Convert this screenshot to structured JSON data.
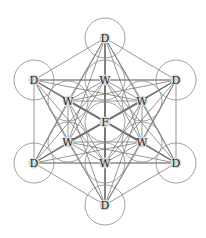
{
  "diagram": {
    "colors": {
      "line": "#6a6a6a",
      "ring": "#8a8a8a",
      "halo": "#d8d8d8",
      "label": "#2a2a2a"
    },
    "ring_radius": 20,
    "nodes": [
      {
        "id": "center",
        "label": "F",
        "x": 105,
        "y": 122,
        "ring": true
      },
      {
        "id": "w_top",
        "label": "W",
        "x": 105,
        "y": 80,
        "ring": true
      },
      {
        "id": "w_ul",
        "label": "W",
        "x": 68,
        "y": 101,
        "ring": true
      },
      {
        "id": "w_ur",
        "label": "W",
        "x": 142,
        "y": 101,
        "ring": true
      },
      {
        "id": "w_ll",
        "label": "W",
        "x": 68,
        "y": 142,
        "ring": true
      },
      {
        "id": "w_lr",
        "label": "W",
        "x": 142,
        "y": 142,
        "ring": true
      },
      {
        "id": "w_bot",
        "label": "W",
        "x": 105,
        "y": 163,
        "ring": true
      },
      {
        "id": "d_top",
        "label": "D",
        "x": 105,
        "y": 38,
        "ring": true
      },
      {
        "id": "d_ul",
        "label": "D",
        "x": 34,
        "y": 80,
        "ring": true
      },
      {
        "id": "d_ur",
        "label": "D",
        "x": 176,
        "y": 80,
        "ring": true
      },
      {
        "id": "d_ll",
        "label": "D",
        "x": 34,
        "y": 163,
        "ring": true
      },
      {
        "id": "d_lr",
        "label": "D",
        "x": 176,
        "y": 163,
        "ring": true
      },
      {
        "id": "d_bot",
        "label": "D",
        "x": 105,
        "y": 205,
        "ring": true
      }
    ]
  }
}
